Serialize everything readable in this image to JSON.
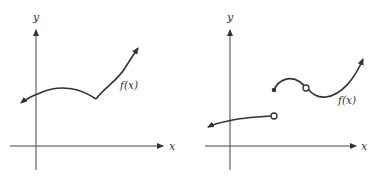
{
  "figures": [
    {
      "name": "continuous-with-corner",
      "axes": {
        "x_label": "x",
        "y_label": "y"
      },
      "curve_label": "f(x)",
      "features": [
        "corner (cusp) point",
        "continuous everywhere"
      ]
    },
    {
      "name": "discontinuous-function",
      "axes": {
        "x_label": "x",
        "y_label": "y"
      },
      "curve_label": "f(x)",
      "features": [
        "jump discontinuity with open circle on left piece and filled dot on right piece",
        "removable discontinuity (open circle) on upper piece"
      ]
    }
  ],
  "colors": {
    "stroke": "#333333",
    "background": "#ffffff"
  }
}
